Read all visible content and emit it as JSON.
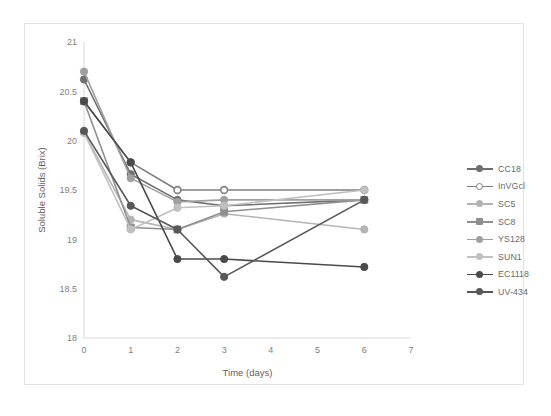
{
  "chart_data": {
    "type": "line",
    "title": "",
    "xlabel": "Time (days)",
    "ylabel": "Soluble Solids (Brix)",
    "xlim": [
      0,
      7
    ],
    "ylim": [
      18,
      21
    ],
    "xticks": [
      "0",
      "1",
      "2",
      "3",
      "4",
      "5",
      "6",
      "7"
    ],
    "yticks": [
      "18",
      "18.5",
      "19",
      "19.5",
      "20",
      "20.5",
      "21"
    ],
    "grid": false,
    "legend_position": "right",
    "x": [
      0,
      1,
      2,
      3,
      6
    ],
    "series": [
      {
        "name": "CC18",
        "color": "#6f6f6f",
        "marker": "filled-circle",
        "values": [
          20.62,
          19.66,
          19.4,
          19.34,
          19.4
        ]
      },
      {
        "name": "InVGcl",
        "color": "#7f7f7f",
        "marker": "open-circle",
        "values": [
          20.4,
          19.78,
          19.5,
          19.5,
          19.5
        ]
      },
      {
        "name": "SC5",
        "color": "#b4b4b4",
        "marker": "filled-circle",
        "values": [
          20.08,
          19.2,
          19.1,
          19.26,
          19.1
        ]
      },
      {
        "name": "SC8",
        "color": "#8f8f8f",
        "marker": "filled-square",
        "values": [
          20.4,
          19.12,
          19.1,
          19.28,
          19.4
        ]
      },
      {
        "name": "YS128",
        "color": "#a0a0a0",
        "marker": "filled-circle",
        "values": [
          20.7,
          19.62,
          19.38,
          19.4,
          19.4
        ]
      },
      {
        "name": "SUN1",
        "color": "#c0c0c0",
        "marker": "filled-circle",
        "values": [
          20.08,
          19.1,
          19.32,
          19.34,
          19.5
        ]
      },
      {
        "name": "EC1118",
        "color": "#4a4a4a",
        "marker": "filled-circle",
        "values": [
          20.4,
          19.78,
          18.8,
          18.8,
          18.72
        ]
      },
      {
        "name": "UV-434",
        "color": "#585858",
        "marker": "filled-circle",
        "values": [
          20.1,
          19.34,
          19.1,
          18.62,
          19.4
        ]
      }
    ]
  },
  "legend": {
    "items": [
      {
        "label": "CC18"
      },
      {
        "label": "InVGcl"
      },
      {
        "label": "SC5"
      },
      {
        "label": "SC8"
      },
      {
        "label": "YS128"
      },
      {
        "label": "SUN1"
      },
      {
        "label": "EC1118"
      },
      {
        "label": "UV-434"
      }
    ]
  }
}
